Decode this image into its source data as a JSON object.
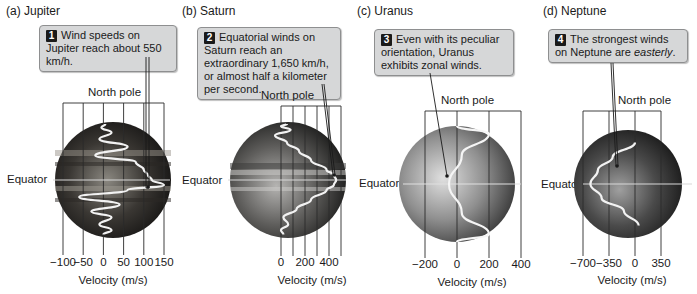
{
  "figure": {
    "common": {
      "north_pole_label": "North pole",
      "equator_label": "Equator",
      "velocity_axis_label": "Velocity (m/s)"
    },
    "panels": [
      {
        "id": "jupiter",
        "label": "(a)  Jupiter",
        "callout_number": "1",
        "callout_text": "Wind speeds on Jupiter reach about 550 km/h.",
        "ticks": [
          "−100",
          "−50",
          "0",
          "50",
          "100",
          "150"
        ],
        "tick_values": [
          -100,
          -50,
          0,
          50,
          100,
          150
        ],
        "planet_colors": [
          "#8a8780",
          "#3a3733",
          "#141312"
        ]
      },
      {
        "id": "saturn",
        "label": "(b)  Saturn",
        "callout_number": "2",
        "callout_text": "Equatorial winds on Saturn reach an extraordinary 1,650 km/h, or almost half a kilometer per second.",
        "ticks": [
          "0",
          "200",
          "400"
        ],
        "tick_values": [
          0,
          200,
          400
        ],
        "grid_values": [
          0,
          100,
          200,
          300,
          400,
          500
        ],
        "planet_colors": [
          "#b5b4b2",
          "#5e5d5b",
          "#1e1e1d"
        ]
      },
      {
        "id": "uranus",
        "label": "(c)  Uranus",
        "callout_number": "3",
        "callout_text": "Even with its peculiar orientation, Uranus exhibits zonal winds.",
        "ticks": [
          "−200",
          "0",
          "200",
          "400"
        ],
        "tick_values": [
          -200,
          0,
          200,
          400
        ],
        "planet_colors": [
          "#e0e0e0",
          "#8f8f8f",
          "#3a3a3a"
        ]
      },
      {
        "id": "neptune",
        "label": "(d)  Neptune",
        "callout_number": "4",
        "callout_text_before": "The strongest winds on Neptune are ",
        "callout_text_emphasis": "easterly",
        "callout_text_after": ".",
        "ticks": [
          "−700",
          "−350",
          "0",
          "350"
        ],
        "tick_values": [
          -700,
          -350,
          0,
          350
        ],
        "planet_colors": [
          "#a0a0a0",
          "#4a4a4a",
          "#1a1a1a"
        ]
      }
    ]
  },
  "chart_data": [
    {
      "type": "line",
      "title": "Jupiter zonal wind profile",
      "xlabel": "Velocity (m/s)",
      "ylabel": "Latitude (North pole to South, Equator at center)",
      "xlim": [
        -100,
        150
      ],
      "x_ticks": [
        -100,
        -50,
        0,
        50,
        100,
        150
      ],
      "note": "Oscillating profile with multiple jets; peak near 150 m/s just south of the equator",
      "lat_deg": [
        75,
        65,
        55,
        45,
        35,
        25,
        18,
        10,
        5,
        0,
        -5,
        -10,
        -17,
        -25,
        -33,
        -40,
        -50,
        -60,
        -70
      ],
      "velocity": [
        5,
        -5,
        20,
        -10,
        60,
        -20,
        80,
        100,
        110,
        120,
        150,
        60,
        -60,
        40,
        -30,
        20,
        -10,
        20,
        0
      ]
    },
    {
      "type": "line",
      "title": "Saturn zonal wind profile",
      "xlabel": "Velocity (m/s)",
      "xlim": [
        0,
        500
      ],
      "x_ticks": [
        0,
        200,
        400
      ],
      "lat_deg": [
        75,
        68,
        60,
        50,
        40,
        30,
        20,
        10,
        5,
        0,
        -5,
        -10,
        -20,
        -30,
        -40,
        -50,
        -60,
        -70
      ],
      "velocity": [
        50,
        0,
        80,
        -50,
        50,
        150,
        250,
        380,
        440,
        460,
        440,
        380,
        250,
        130,
        20,
        60,
        0,
        20
      ]
    },
    {
      "type": "line",
      "title": "Uranus zonal wind profile",
      "xlabel": "Velocity (m/s)",
      "xlim": [
        -200,
        400
      ],
      "x_ticks": [
        -200,
        0,
        200,
        400
      ],
      "lat_deg": [
        90,
        60,
        30,
        0,
        -30,
        -60,
        -90
      ],
      "velocity": [
        0,
        200,
        30,
        -50,
        30,
        200,
        0
      ]
    },
    {
      "type": "line",
      "title": "Neptune zonal wind profile",
      "xlabel": "Velocity (m/s)",
      "xlim": [
        -700,
        350
      ],
      "x_ticks": [
        -700,
        -350,
        0,
        350
      ],
      "lat_deg": [
        50,
        30,
        15,
        0,
        -15,
        -30,
        -50
      ],
      "velocity": [
        0,
        -300,
        -500,
        -600,
        -450,
        -150,
        50
      ]
    }
  ]
}
